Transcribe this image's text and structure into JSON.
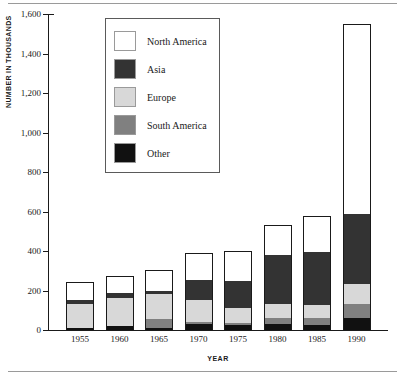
{
  "chart_data": {
    "type": "bar",
    "subtype": "stacked-bar",
    "title": "",
    "xlabel": "YEAR",
    "ylabel": "NUMBER IN THOUSANDS",
    "ylim": [
      0,
      1600
    ],
    "yticks": [
      "0",
      "200",
      "400",
      "600",
      "800",
      "1,000",
      "1,200",
      "1,400",
      "1,600"
    ],
    "ytick_values": [
      0,
      200,
      400,
      600,
      800,
      1000,
      1200,
      1400,
      1600
    ],
    "grid": false,
    "legend_position": "upper-left-inside",
    "categories": [
      "1955",
      "1960",
      "1965",
      "1970",
      "1975",
      "1980",
      "1985",
      "1990"
    ],
    "stack_order_bottom_to_top": [
      "Other",
      "South America",
      "Europe",
      "Asia",
      "North America"
    ],
    "series": [
      {
        "name": "Other",
        "color": "#111111",
        "values": [
          12,
          22,
          10,
          30,
          25,
          30,
          25,
          62
        ]
      },
      {
        "name": "South America",
        "color": "#808080",
        "values": [
          0,
          0,
          45,
          12,
          12,
          30,
          35,
          68
        ]
      },
      {
        "name": "Europe",
        "color": "#d8d8d8",
        "values": [
          118,
          140,
          125,
          108,
          73,
          70,
          65,
          105
        ]
      },
      {
        "name": "Asia",
        "color": "#333333",
        "values": [
          20,
          25,
          20,
          105,
          140,
          250,
          270,
          350
        ]
      },
      {
        "name": "North America",
        "color": "#ffffff",
        "values": [
          95,
          85,
          105,
          135,
          150,
          150,
          180,
          965
        ]
      }
    ],
    "totals": [
      245,
      272,
      305,
      390,
      400,
      530,
      575,
      1550
    ]
  },
  "legend": {
    "items": [
      {
        "label": "North America",
        "swatch": "#ffffff"
      },
      {
        "label": "Asia",
        "swatch": "#333333"
      },
      {
        "label": "Europe",
        "swatch": "#d8d8d8"
      },
      {
        "label": "South America",
        "swatch": "#808080"
      },
      {
        "label": "Other",
        "swatch": "#111111"
      }
    ]
  }
}
